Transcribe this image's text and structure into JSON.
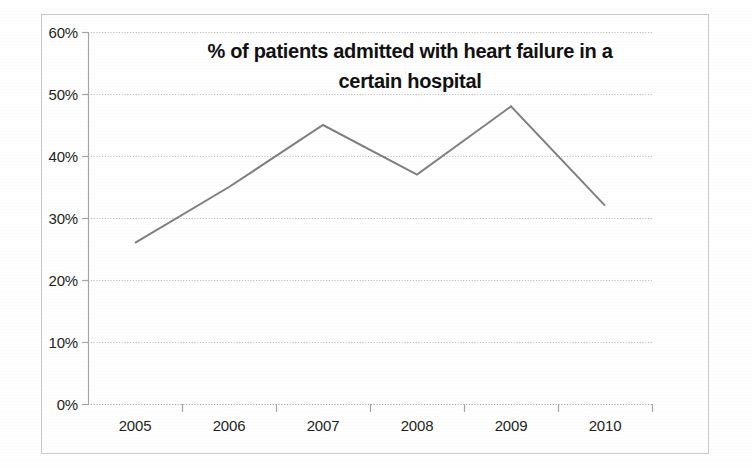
{
  "chart_data": {
    "type": "line",
    "title": "% of patients admitted with heart failure in a certain hospital",
    "title_line1": "% of patients admitted with heart failure in a",
    "title_line2": "certain hospital",
    "xlabel": "",
    "ylabel": "",
    "categories": [
      "2005",
      "2006",
      "2007",
      "2008",
      "2009",
      "2010"
    ],
    "values": [
      26,
      35,
      45,
      37,
      48,
      32
    ],
    "value_labels": [
      "26%",
      "35%",
      "45%",
      "37%",
      "48%",
      "32%"
    ],
    "ylim": [
      0,
      60
    ],
    "ytick_values": [
      0,
      10,
      20,
      30,
      40,
      50,
      60
    ],
    "ytick_labels": [
      "0%",
      "10%",
      "20%",
      "30%",
      "40%",
      "50%",
      "60%"
    ],
    "grid": true,
    "grid_style": "dotted-horizontal",
    "legend": false,
    "legend_position": "none",
    "series": [
      {
        "name": "% of patients admitted with heart failure",
        "values": [
          26,
          35,
          45,
          37,
          48,
          32
        ]
      }
    ],
    "colors": {
      "line": "#7f7f7f",
      "grid": "#bfbfbf",
      "axis": "#a6a6a6",
      "text": "#231f20",
      "title": "#111111",
      "frame": "#c9c9c9",
      "background": "#ffffff"
    },
    "markers": false,
    "line_width": 2
  }
}
